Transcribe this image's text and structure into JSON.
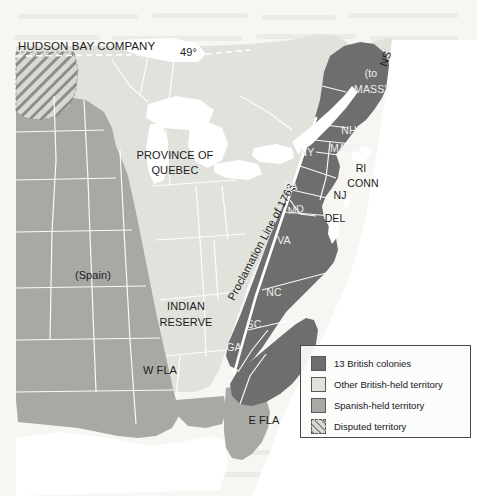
{
  "figure": {
    "kind": "historical-map"
  },
  "map": {
    "colors": {
      "paper": "#f7f6f3",
      "water": "#ffffff",
      "thirteen_colonies": "#6e6e6e",
      "other_british": "#e2e2dd",
      "spanish": "#a8a8a4",
      "disputed_hatch": "#8d8d89",
      "boundary_line": "#ffffff",
      "label_dark": "#1c1c1c",
      "label_light": "#efefef"
    },
    "annotations": {
      "hudson_bay_company": "HUDSON BAY COMPANY",
      "parallel_49": "49°",
      "province_of_quebec_line1": "PROVINCE OF",
      "province_of_quebec_line2": "QUEBEC",
      "proclamation_line": "Proclamation Line of 1763",
      "spain": "(Spain)",
      "indian_reserve_line1": "INDIAN",
      "indian_reserve_line2": "RESERVE",
      "west_florida": "W FLA",
      "east_florida": "E FLA",
      "nova_scotia": "NS",
      "to_mass_line1": "(to",
      "to_mass_line2": "MASS)"
    },
    "colony_labels": [
      {
        "id": "new-hampshire",
        "text": "NH"
      },
      {
        "id": "massachusetts",
        "text": "MASS"
      },
      {
        "id": "rhode-island",
        "text": "RI"
      },
      {
        "id": "connecticut",
        "text": "CONN"
      },
      {
        "id": "new-york",
        "text": "NY"
      },
      {
        "id": "new-jersey",
        "text": "NJ"
      },
      {
        "id": "pennsylvania",
        "text": "PA"
      },
      {
        "id": "delaware",
        "text": "DEL"
      },
      {
        "id": "maryland",
        "text": "MD"
      },
      {
        "id": "virginia",
        "text": "VA"
      },
      {
        "id": "north-carolina",
        "text": "NC"
      },
      {
        "id": "south-carolina",
        "text": "SC"
      },
      {
        "id": "georgia",
        "text": "GA"
      }
    ]
  },
  "legend": {
    "items": [
      {
        "swatch": "thirteen-colonies",
        "label": "13 British colonies"
      },
      {
        "swatch": "other-british",
        "label": "Other British-held territory"
      },
      {
        "swatch": "spanish",
        "label": "Spanish-held territory"
      },
      {
        "swatch": "disputed",
        "label": "Disputed territory"
      }
    ]
  }
}
